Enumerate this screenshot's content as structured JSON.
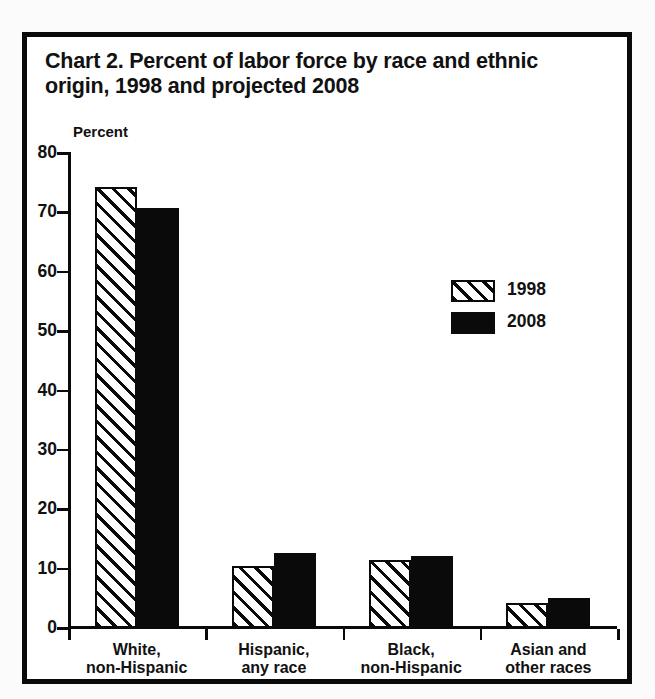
{
  "figure": {
    "title": "Chart 2. Percent of labor force by race and ethnic origin, 1998 and projected 2008"
  },
  "chart_data": {
    "type": "bar",
    "title": "Chart 2. Percent of labor force by race and ethnic origin, 1998 and projected 2008",
    "xlabel": "",
    "ylabel": "Percent",
    "ylim": [
      0,
      80
    ],
    "yticks": [
      0,
      10,
      20,
      30,
      40,
      50,
      60,
      70,
      80
    ],
    "ytick_labels": [
      "0",
      "10",
      "20",
      "30",
      "40",
      "50",
      "60",
      "70",
      "80"
    ],
    "grid": false,
    "legend_position": "center-right",
    "categories": [
      "White,\nnon-Hispanic",
      "Hispanic,\nany race",
      "Black,\nnon-Hispanic",
      "Asian and\nother races"
    ],
    "series": [
      {
        "name": "1998",
        "fill": "diagonal-hatch",
        "color": "#0a0a0a",
        "values": [
          74.3,
          10.4,
          11.5,
          4.2
        ]
      },
      {
        "name": "2008",
        "fill": "solid",
        "color": "#0a0a0a",
        "values": [
          70.8,
          12.7,
          12.2,
          5.1
        ]
      }
    ]
  },
  "legend": {
    "items": [
      {
        "label": "1998",
        "swatch": "hatched-swatch"
      },
      {
        "label": "2008",
        "swatch": "solid-swatch"
      }
    ]
  },
  "colors": {
    "ink": "#0a0a0a",
    "paper": "#ffffff",
    "page": "#fbfbfb"
  }
}
